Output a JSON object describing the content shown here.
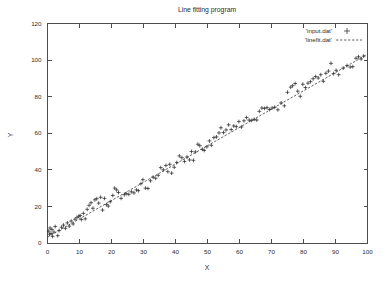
{
  "chart_data": {
    "type": "scatter",
    "title": "Line fitting program",
    "xlabel": "X",
    "ylabel": "Y",
    "xlim": [
      0,
      100
    ],
    "ylim": [
      0,
      120
    ],
    "xticks": [
      0,
      10,
      20,
      30,
      40,
      50,
      60,
      70,
      80,
      90,
      100
    ],
    "yticks": [
      0,
      20,
      40,
      60,
      80,
      100,
      120
    ],
    "grid": false,
    "legend_position": "top-right",
    "colors": {
      "marker": "#2b2b2b",
      "fit_line": "#3a3a3a",
      "axis": "#4d4d4d",
      "background": "#ffffff"
    },
    "series": [
      {
        "name": "'input.dat'",
        "type": "scatter",
        "marker": "plus",
        "points": [
          [
            0.4,
            6.5
          ],
          [
            0.6,
            4.8
          ],
          [
            0.8,
            8.2
          ],
          [
            1.1,
            5.2
          ],
          [
            1.4,
            7.4
          ],
          [
            1.6,
            3.6
          ],
          [
            2.0,
            6.0
          ],
          [
            2.4,
            9.0
          ],
          [
            3.2,
            4.0
          ],
          [
            3.6,
            6.8
          ],
          [
            4.4,
            8.6
          ],
          [
            5.0,
            9.8
          ],
          [
            5.6,
            8.0
          ],
          [
            6.2,
            11.0
          ],
          [
            6.8,
            9.2
          ],
          [
            7.4,
            12.0
          ],
          [
            8.0,
            10.4
          ],
          [
            8.6,
            13.0
          ],
          [
            9.2,
            14.0
          ],
          [
            9.8,
            14.6
          ],
          [
            10.2,
            15.0
          ],
          [
            10.6,
            12.8
          ],
          [
            11.2,
            16.2
          ],
          [
            11.8,
            13.2
          ],
          [
            12.4,
            18.4
          ],
          [
            13.0,
            20.6
          ],
          [
            13.6,
            22.0
          ],
          [
            14.2,
            19.0
          ],
          [
            14.8,
            23.6
          ],
          [
            15.4,
            24.2
          ],
          [
            16.0,
            21.8
          ],
          [
            16.6,
            25.0
          ],
          [
            17.2,
            18.0
          ],
          [
            17.8,
            24.4
          ],
          [
            18.4,
            21.0
          ],
          [
            19.0,
            20.2
          ],
          [
            19.6,
            22.6
          ],
          [
            20.4,
            26.0
          ],
          [
            21.0,
            30.0
          ],
          [
            21.6,
            29.0
          ],
          [
            22.2,
            27.6
          ],
          [
            23.0,
            24.4
          ],
          [
            24.0,
            26.4
          ],
          [
            24.6,
            27.0
          ],
          [
            25.4,
            26.6
          ],
          [
            26.2,
            28.0
          ],
          [
            27.0,
            27.4
          ],
          [
            27.8,
            29.0
          ],
          [
            28.4,
            28.6
          ],
          [
            29.2,
            32.4
          ],
          [
            29.8,
            34.6
          ],
          [
            30.6,
            30.0
          ],
          [
            31.4,
            29.8
          ],
          [
            32.2,
            34.0
          ],
          [
            33.0,
            36.0
          ],
          [
            33.8,
            35.4
          ],
          [
            34.6,
            37.0
          ],
          [
            35.4,
            41.2
          ],
          [
            36.2,
            40.0
          ],
          [
            37.0,
            42.4
          ],
          [
            37.6,
            39.0
          ],
          [
            38.2,
            43.0
          ],
          [
            38.8,
            38.2
          ],
          [
            39.6,
            41.4
          ],
          [
            40.4,
            44.0
          ],
          [
            41.2,
            47.6
          ],
          [
            42.0,
            46.6
          ],
          [
            42.8,
            44.6
          ],
          [
            43.6,
            47.0
          ],
          [
            44.4,
            45.4
          ],
          [
            45.0,
            50.0
          ],
          [
            45.6,
            45.2
          ],
          [
            46.2,
            49.8
          ],
          [
            47.0,
            54.0
          ],
          [
            47.6,
            53.2
          ],
          [
            48.4,
            51.2
          ],
          [
            49.0,
            50.6
          ],
          [
            49.8,
            52.6
          ],
          [
            50.6,
            55.8
          ],
          [
            51.2,
            53.4
          ],
          [
            52.0,
            57.6
          ],
          [
            52.8,
            58.0
          ],
          [
            53.6,
            60.2
          ],
          [
            54.2,
            63.0
          ],
          [
            55.0,
            60.4
          ],
          [
            55.8,
            61.8
          ],
          [
            56.6,
            64.6
          ],
          [
            57.4,
            62.0
          ],
          [
            58.2,
            64.0
          ],
          [
            59.0,
            63.6
          ],
          [
            59.8,
            66.4
          ],
          [
            60.6,
            63.4
          ],
          [
            61.4,
            66.8
          ],
          [
            62.2,
            68.6
          ],
          [
            63.0,
            67.2
          ],
          [
            63.8,
            67.0
          ],
          [
            64.6,
            67.6
          ],
          [
            65.4,
            67.2
          ],
          [
            66.2,
            72.0
          ],
          [
            67.0,
            73.8
          ],
          [
            67.8,
            73.6
          ],
          [
            68.6,
            74.0
          ],
          [
            69.4,
            73.0
          ],
          [
            70.2,
            73.8
          ],
          [
            71.0,
            74.2
          ],
          [
            72.0,
            72.8
          ],
          [
            73.0,
            76.6
          ],
          [
            74.0,
            75.0
          ],
          [
            75.0,
            82.4
          ],
          [
            76.0,
            85.2
          ],
          [
            76.6,
            86.0
          ],
          [
            77.4,
            87.2
          ],
          [
            78.2,
            83.0
          ],
          [
            79.0,
            80.2
          ],
          [
            79.8,
            86.8
          ],
          [
            80.6,
            85.0
          ],
          [
            81.4,
            87.4
          ],
          [
            82.2,
            88.2
          ],
          [
            83.0,
            89.8
          ],
          [
            83.8,
            91.0
          ],
          [
            84.6,
            90.2
          ],
          [
            85.4,
            92.0
          ],
          [
            86.2,
            88.4
          ],
          [
            87.0,
            92.8
          ],
          [
            87.8,
            94.0
          ],
          [
            88.6,
            98.2
          ],
          [
            89.4,
            92.6
          ],
          [
            90.2,
            94.4
          ],
          [
            91.0,
            92.0
          ],
          [
            92.4,
            95.6
          ],
          [
            93.6,
            97.0
          ],
          [
            94.6,
            96.2
          ],
          [
            95.4,
            96.4
          ],
          [
            96.4,
            101.0
          ],
          [
            97.2,
            101.8
          ],
          [
            98.0,
            100.6
          ],
          [
            98.8,
            102.2
          ]
        ]
      },
      {
        "name": "'linefit.dat'",
        "type": "line",
        "style": "dashed",
        "fit": {
          "slope": 1.0,
          "intercept": 3.2
        },
        "endpoints": [
          [
            0,
            3.2
          ],
          [
            100,
            103.2
          ]
        ]
      }
    ]
  },
  "legend": {
    "entries": [
      {
        "label": "'input.dat'",
        "marker": "plus"
      },
      {
        "label": "'linefit.dat'",
        "marker": "dashed-line"
      }
    ]
  },
  "axes": {
    "x_title": "X",
    "y_title": "Y",
    "x_tick_labels": [
      "0",
      "10",
      "20",
      "30",
      "40",
      "50",
      "60",
      "70",
      "80",
      "90",
      "100"
    ],
    "y_tick_labels": [
      "0",
      "20",
      "40",
      "60",
      "80",
      "100",
      "120"
    ]
  },
  "title": "Line fitting program"
}
